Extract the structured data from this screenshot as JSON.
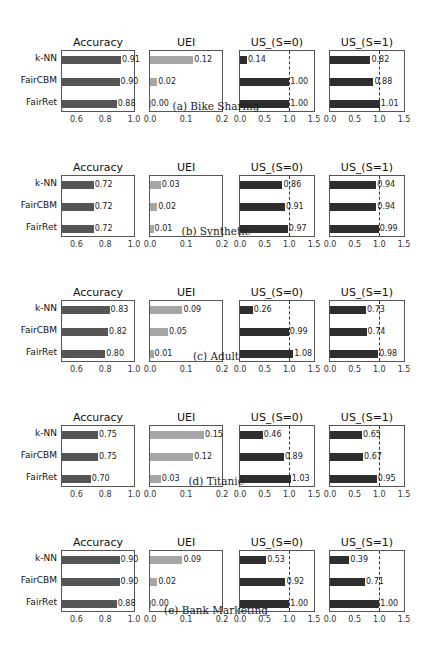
{
  "figure": {
    "panel_titles": [
      "Accuracy",
      "UEI",
      "US_(S=0)",
      "US_(S=1)"
    ],
    "methods": [
      "k-NN",
      "FairCBM",
      "FairRet"
    ],
    "captions": [
      "(a) Bike Sharing",
      "(b) Synthetic",
      "(c) Adult",
      "(d) Titanic",
      "(e) Bank Marketing"
    ],
    "footer_text": "Figure: Accuracy, UEI and utility-share comparison of k-NN, FairCBM and FairRet across five datasets"
  },
  "colors": {
    "accuracy_bar": "#555555",
    "uei_bar": "#a6a6a6",
    "us_bar": "#2e2e2e",
    "axes_border": "#555555",
    "refline": "#333333"
  },
  "chart_data": [
    {
      "dataset": "Bike Sharing",
      "caption": "(a) Bike Sharing",
      "type": "bar",
      "orientation": "horizontal",
      "categories": [
        "k-NN",
        "FairCBM",
        "FairRet"
      ],
      "panels": [
        {
          "title": "Accuracy",
          "values": [
            0.91,
            0.9,
            0.88
          ],
          "labels": [
            "0.91",
            "0.90",
            "0.88"
          ],
          "xlim": [
            0.5,
            1.0
          ],
          "xticks": [
            "0.6",
            "0.8",
            "1.0"
          ]
        },
        {
          "title": "UEI",
          "values": [
            0.12,
            0.02,
            0.0
          ],
          "labels": [
            "0.12",
            "0.02",
            "0.00"
          ],
          "xlim": [
            0.0,
            0.2
          ],
          "xticks": [
            "0.0",
            "0.1",
            "0.2"
          ]
        },
        {
          "title": "US_(S=0)",
          "values": [
            0.14,
            1.0,
            1.0
          ],
          "labels": [
            "0.14",
            "1.00",
            "1.00"
          ],
          "xlim": [
            0.0,
            1.5
          ],
          "xticks": [
            "0.0",
            "0.5",
            "1.0",
            "1.5"
          ],
          "refline": 1.0
        },
        {
          "title": "US_(S=1)",
          "values": [
            0.82,
            0.88,
            1.01
          ],
          "labels": [
            "0.82",
            "0.88",
            "1.01"
          ],
          "xlim": [
            0.0,
            1.5
          ],
          "xticks": [
            "0.0",
            "0.5",
            "1.0",
            "1.5"
          ],
          "refline": 1.0
        }
      ]
    },
    {
      "dataset": "Synthetic",
      "caption": "(b) Synthetic",
      "type": "bar",
      "orientation": "horizontal",
      "categories": [
        "k-NN",
        "FairCBM",
        "FairRet"
      ],
      "panels": [
        {
          "title": "Accuracy",
          "values": [
            0.72,
            0.72,
            0.72
          ],
          "labels": [
            "0.72",
            "0.72",
            "0.72"
          ],
          "xlim": [
            0.5,
            1.0
          ],
          "xticks": [
            "0.6",
            "0.8",
            "1.0"
          ]
        },
        {
          "title": "UEI",
          "values": [
            0.03,
            0.02,
            0.01
          ],
          "labels": [
            "0.03",
            "0.02",
            "0.01"
          ],
          "xlim": [
            0.0,
            0.2
          ],
          "xticks": [
            "0.0",
            "0.1",
            "0.2"
          ]
        },
        {
          "title": "US_(S=0)",
          "values": [
            0.86,
            0.91,
            0.97
          ],
          "labels": [
            "0.86",
            "0.91",
            "0.97"
          ],
          "xlim": [
            0.0,
            1.5
          ],
          "xticks": [
            "0.0",
            "0.5",
            "1.0",
            "1.5"
          ],
          "refline": 1.0
        },
        {
          "title": "US_(S=1)",
          "values": [
            0.94,
            0.94,
            0.99
          ],
          "labels": [
            "0.94",
            "0.94",
            "0.99"
          ],
          "xlim": [
            0.0,
            1.5
          ],
          "xticks": [
            "0.0",
            "0.5",
            "1.0",
            "1.5"
          ],
          "refline": 1.0
        }
      ]
    },
    {
      "dataset": "Adult",
      "caption": "(c) Adult",
      "type": "bar",
      "orientation": "horizontal",
      "categories": [
        "k-NN",
        "FairCBM",
        "FairRet"
      ],
      "panels": [
        {
          "title": "Accuracy",
          "values": [
            0.83,
            0.82,
            0.8
          ],
          "labels": [
            "0.83",
            "0.82",
            "0.80"
          ],
          "xlim": [
            0.5,
            1.0
          ],
          "xticks": [
            "0.6",
            "0.8",
            "1.0"
          ]
        },
        {
          "title": "UEI",
          "values": [
            0.09,
            0.05,
            0.01
          ],
          "labels": [
            "0.09",
            "0.05",
            "0.01"
          ],
          "xlim": [
            0.0,
            0.2
          ],
          "xticks": [
            "0.0",
            "0.1",
            "0.2"
          ]
        },
        {
          "title": "US_(S=0)",
          "values": [
            0.26,
            0.99,
            1.08
          ],
          "labels": [
            "0.26",
            "0.99",
            "1.08"
          ],
          "xlim": [
            0.0,
            1.5
          ],
          "xticks": [
            "0.0",
            "0.5",
            "1.0",
            "1.5"
          ],
          "refline": 1.0
        },
        {
          "title": "US_(S=1)",
          "values": [
            0.73,
            0.74,
            0.98
          ],
          "labels": [
            "0.73",
            "0.74",
            "0.98"
          ],
          "xlim": [
            0.0,
            1.5
          ],
          "xticks": [
            "0.0",
            "0.5",
            "1.0",
            "1.5"
          ],
          "refline": 1.0
        }
      ]
    },
    {
      "dataset": "Titanic",
      "caption": "(d) Titanic",
      "type": "bar",
      "orientation": "horizontal",
      "categories": [
        "k-NN",
        "FairCBM",
        "FairRet"
      ],
      "panels": [
        {
          "title": "Accuracy",
          "values": [
            0.75,
            0.75,
            0.7
          ],
          "labels": [
            "0.75",
            "0.75",
            "0.70"
          ],
          "xlim": [
            0.5,
            1.0
          ],
          "xticks": [
            "0.6",
            "0.8",
            "1.0"
          ]
        },
        {
          "title": "UEI",
          "values": [
            0.15,
            0.12,
            0.03
          ],
          "labels": [
            "0.15",
            "0.12",
            "0.03"
          ],
          "xlim": [
            0.0,
            0.2
          ],
          "xticks": [
            "0.0",
            "0.1",
            "0.2"
          ]
        },
        {
          "title": "US_(S=0)",
          "values": [
            0.46,
            0.89,
            1.03
          ],
          "labels": [
            "0.46",
            "0.89",
            "1.03"
          ],
          "xlim": [
            0.0,
            1.5
          ],
          "xticks": [
            "0.0",
            "0.5",
            "1.0",
            "1.5"
          ],
          "refline": 1.0
        },
        {
          "title": "US_(S=1)",
          "values": [
            0.65,
            0.67,
            0.95
          ],
          "labels": [
            "0.65",
            "0.67",
            "0.95"
          ],
          "xlim": [
            0.0,
            1.5
          ],
          "xticks": [
            "0.0",
            "0.5",
            "1.0",
            "1.5"
          ],
          "refline": 1.0
        }
      ]
    },
    {
      "dataset": "Bank Marketing",
      "caption": "(e) Bank Marketing",
      "type": "bar",
      "orientation": "horizontal",
      "categories": [
        "k-NN",
        "FairCBM",
        "FairRet"
      ],
      "panels": [
        {
          "title": "Accuracy",
          "values": [
            0.9,
            0.9,
            0.88
          ],
          "labels": [
            "0.90",
            "0.90",
            "0.88"
          ],
          "xlim": [
            0.5,
            1.0
          ],
          "xticks": [
            "0.6",
            "0.8",
            "1.0"
          ]
        },
        {
          "title": "UEI",
          "values": [
            0.09,
            0.02,
            0.0
          ],
          "labels": [
            "0.09",
            "0.02",
            "0.00"
          ],
          "xlim": [
            0.0,
            0.2
          ],
          "xticks": [
            "0.0",
            "0.1",
            "0.2"
          ]
        },
        {
          "title": "US_(S=0)",
          "values": [
            0.53,
            0.92,
            1.0
          ],
          "labels": [
            "0.53",
            "0.92",
            "1.00"
          ],
          "xlim": [
            0.0,
            1.5
          ],
          "xticks": [
            "0.0",
            "0.5",
            "1.0",
            "1.5"
          ],
          "refline": 1.0
        },
        {
          "title": "US_(S=1)",
          "values": [
            0.39,
            0.71,
            1.0
          ],
          "labels": [
            "0.39",
            "0.71",
            "1.00"
          ],
          "xlim": [
            0.0,
            1.5
          ],
          "xticks": [
            "0.0",
            "0.5",
            "1.0",
            "1.5"
          ],
          "refline": 1.0
        }
      ]
    }
  ]
}
